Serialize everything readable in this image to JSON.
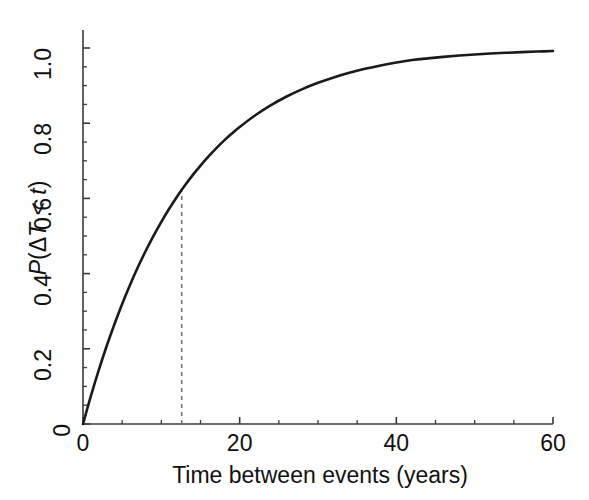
{
  "chart_data": {
    "type": "line",
    "title": "",
    "subtitle": "",
    "xlabel": "Time between events (years)",
    "ylabel": "P(ΔT < t)",
    "xlim": [
      0,
      60
    ],
    "ylim": [
      0,
      1.04
    ],
    "grid": false,
    "legend": null,
    "x_major_ticks": [
      0,
      20,
      40,
      60
    ],
    "x_major_tick_labels": [
      "0",
      "20",
      "40",
      "60"
    ],
    "x_minor_ticks": [
      5,
      10,
      15,
      25,
      30,
      35,
      45,
      50,
      55
    ],
    "y_major_ticks": [
      0,
      0.2,
      0.4,
      0.6,
      0.8,
      1.0
    ],
    "y_major_tick_labels": [
      "0",
      "0.2",
      "0.4",
      "0.6",
      "0.8",
      "1.0"
    ],
    "y_minor_ticks": [
      0.05,
      0.1,
      0.15,
      0.25,
      0.3,
      0.35,
      0.45,
      0.5,
      0.55,
      0.65,
      0.7,
      0.75,
      0.85,
      0.9,
      0.95
    ],
    "series": [
      {
        "name": "Exponential CDF",
        "kind": "line",
        "color": "#1a1a1a",
        "linewidth": 2.6,
        "x": [
          0,
          1,
          2,
          3,
          4,
          5,
          6,
          7,
          8,
          9,
          10,
          11,
          12,
          12.6,
          13,
          14,
          15,
          16,
          17,
          18,
          19,
          20,
          22,
          24,
          26,
          28,
          30,
          32,
          34,
          36,
          38,
          40,
          42,
          44,
          46,
          48,
          50,
          52,
          54,
          56,
          58,
          60
        ],
        "y": [
          0.0,
          0.0739,
          0.1424,
          0.206,
          0.2648,
          0.3194,
          0.3699,
          0.4168,
          0.4602,
          0.5005,
          0.5378,
          0.5724,
          0.6045,
          0.6227,
          0.6342,
          0.6618,
          0.6874,
          0.7111,
          0.7331,
          0.7535,
          0.7724,
          0.7899,
          0.8212,
          0.8481,
          0.871,
          0.8906,
          0.9074,
          0.9218,
          0.9341,
          0.9446,
          0.9536,
          0.9613,
          0.9679,
          0.9725,
          0.9765,
          0.9799,
          0.9828,
          0.9852,
          0.9873,
          0.9891,
          0.9906,
          0.9919
        ]
      }
    ],
    "annotations": [
      {
        "kind": "dashed-vline",
        "name": "mean-interval-marker",
        "x": 12.6,
        "y_from": 0.0,
        "y_to": 0.622,
        "color": "#6f6f6f",
        "dash": "4 4",
        "linewidth": 1.5
      }
    ],
    "model": {
      "equation": "P(ΔT < t) = 1 - exp(-t/τ)",
      "tau_years": 13.0
    }
  },
  "axes": {
    "x_title": "Time between events (years)",
    "y_title_parts": {
      "p": "P",
      "open": "(",
      "delta": "Δ",
      "t_upper": "T",
      "less_than": " < ",
      "t_lower": "t",
      "close": ")"
    },
    "x_tick_labels": [
      "0",
      "20",
      "40",
      "60"
    ],
    "y_tick_labels": [
      "0",
      "0.2",
      "0.4",
      "0.6",
      "0.8",
      "1.0"
    ]
  },
  "colors": {
    "curve": "#1a1a1a",
    "axis": "#3a3a3a",
    "dashed_marker": "#6f6f6f",
    "background": "#fefefe",
    "text": "#111111"
  }
}
